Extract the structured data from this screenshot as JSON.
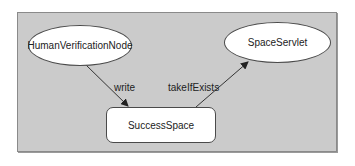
{
  "diagram": {
    "background_color": "#cbcbcb",
    "nodes": [
      {
        "id": "human",
        "label": "HumanVerificationNode",
        "shape": "ellipse"
      },
      {
        "id": "servlet",
        "label": "SpaceServlet",
        "shape": "ellipse"
      },
      {
        "id": "space",
        "label": "SuccessSpace",
        "shape": "rounded-rectangle"
      }
    ],
    "edges": [
      {
        "from": "human",
        "to": "space",
        "label": "write"
      },
      {
        "from": "space",
        "to": "servlet",
        "label": "takeIfExists"
      }
    ]
  }
}
